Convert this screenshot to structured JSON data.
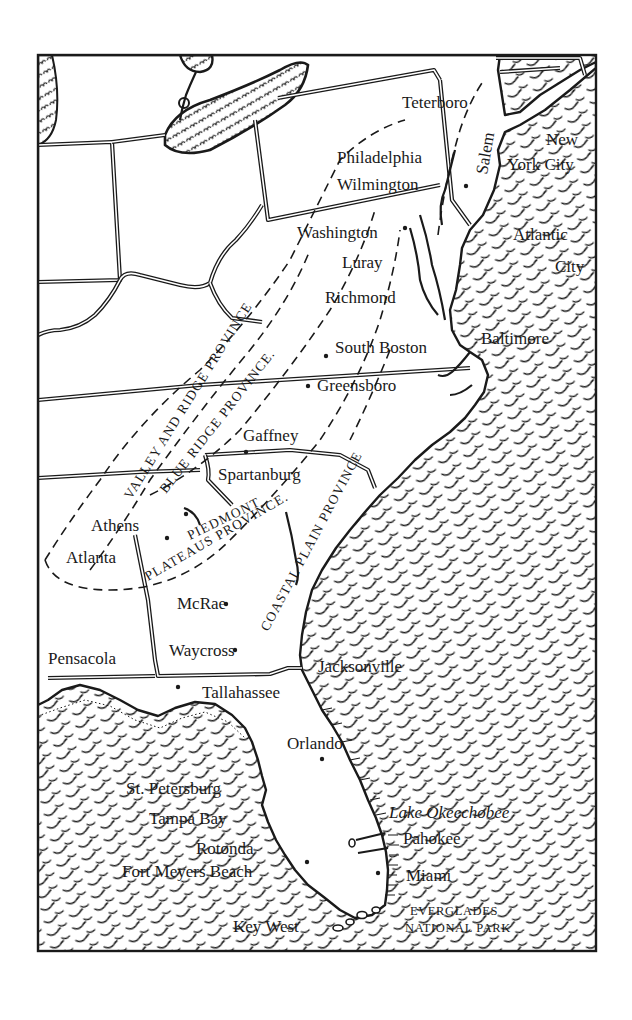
{
  "map": {
    "style": "hand-drawn pen-and-ink",
    "region": "Eastern United States",
    "colors": {
      "ink": "#1a1a1a",
      "paper": "#ffffff"
    },
    "frame": {
      "left": 38,
      "top": 55,
      "right": 596,
      "bottom": 951
    }
  },
  "cities": [
    {
      "name": "Teterboro",
      "x": 402,
      "y": 108
    },
    {
      "name": "New",
      "x": 546,
      "y": 145
    },
    {
      "name": "York City",
      "x": 507,
      "y": 170
    },
    {
      "name": "Philadelphia",
      "x": 337,
      "y": 163
    },
    {
      "name": "Wilmington",
      "x": 337,
      "y": 190
    },
    {
      "name": "Washington",
      "x": 297,
      "y": 238
    },
    {
      "name": "Atlantic",
      "x": 513,
      "y": 240
    },
    {
      "name": "City",
      "x": 555,
      "y": 272
    },
    {
      "name": "Luray",
      "x": 342,
      "y": 268
    },
    {
      "name": "Richmond",
      "x": 325,
      "y": 303
    },
    {
      "name": "Baltimore",
      "x": 481,
      "y": 344
    },
    {
      "name": "South Boston",
      "x": 335,
      "y": 353
    },
    {
      "name": "Greensboro",
      "x": 317,
      "y": 391
    },
    {
      "name": "Gaffney",
      "x": 243,
      "y": 441
    },
    {
      "name": "Spartanburg",
      "x": 218,
      "y": 480
    },
    {
      "name": "Athens",
      "x": 91,
      "y": 531
    },
    {
      "name": "Atlanta",
      "x": 66,
      "y": 563
    },
    {
      "name": "McRae",
      "x": 177,
      "y": 609
    },
    {
      "name": "Waycross",
      "x": 169,
      "y": 656
    },
    {
      "name": "Pensacola",
      "x": 48,
      "y": 664
    },
    {
      "name": "Jacksonville",
      "x": 318,
      "y": 672
    },
    {
      "name": "Tallahassee",
      "x": 202,
      "y": 698
    },
    {
      "name": "Orlando",
      "x": 287,
      "y": 749
    },
    {
      "name": "St. Petersburg",
      "x": 126,
      "y": 794
    },
    {
      "name": "Tampa Bay",
      "x": 149,
      "y": 824
    },
    {
      "name": "Rotonda",
      "x": 196,
      "y": 854
    },
    {
      "name": "Fort Meyers Beach",
      "x": 122,
      "y": 877
    },
    {
      "name": "Pahokee",
      "x": 403,
      "y": 844
    },
    {
      "name": "Miami",
      "x": 406,
      "y": 881
    },
    {
      "name": "Key West",
      "x": 233,
      "y": 932
    }
  ],
  "italic_labels": [
    {
      "name": "Lake Okeechobee",
      "x": 389,
      "y": 818
    },
    {
      "name": "Salem",
      "x": 487,
      "y": 175,
      "rotate": -80
    }
  ],
  "park_labels": [
    {
      "name": "EVERGLADES",
      "x": 410,
      "y": 915
    },
    {
      "name": "NATIONAL PARK",
      "x": 405,
      "y": 932
    }
  ],
  "provinces": [
    {
      "name": "VALLEY AND RIDGE PROVINCE",
      "x": 131,
      "y": 500,
      "rotate": -58
    },
    {
      "name": "BLUE RIDGE PROVINCE.",
      "x": 166,
      "y": 494,
      "rotate": -52
    },
    {
      "name": "PIEDMONT",
      "x": 190,
      "y": 540,
      "rotate": -26
    },
    {
      "name": "PLATEAUS PROVINCE.",
      "x": 148,
      "y": 581,
      "rotate": -30
    },
    {
      "name": "COASTAL PLAIN PROVINCE",
      "x": 268,
      "y": 632,
      "rotate": -62
    }
  ]
}
